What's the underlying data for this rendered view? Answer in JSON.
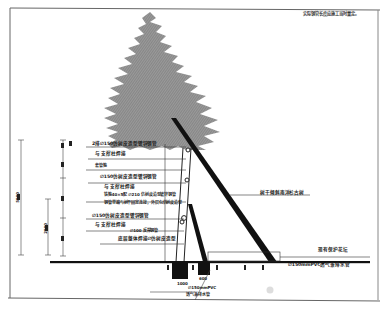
{
  "drawing": {
    "note_top_right": "实际钢管长度应施工当时量定。",
    "labels": {
      "top_pipe": "2排∅150仿树皮造型镀锌钢管",
      "top_pipe_sub": "与 支撑柱焊接",
      "anchor_ring": "套管箍",
      "mid_pipe": "∅150仿树皮造型镀锌钢管",
      "mid_pipe_sub": "与 支撑柱焊接",
      "clamp_note_1": "铁箍40×5配 ∅210 仿树皮造型镀锌钢管",
      "clamp_note_2": "钢管里端与树干固定连接，外层包仿树皮造型",
      "lower_pipe": "∅150仿树皮造型镀锌钢管",
      "lower_pipe_sub": "与 支撑柱焊接",
      "stake": "∅100 反撑钢管",
      "base_frame": "底层整体焊接∅仿树皮造型",
      "tree_name": "树干倾斜南洋杉古树",
      "existing_edge": "现有保护花坛",
      "drain_pipe": "∅150mmPVC透气兼排水管",
      "vent_pipe_1": "∅150mmPVC",
      "vent_pipe_2": "透气兼排水管"
    },
    "dimensions": {
      "overall_height": "5000",
      "mid_height": "2000",
      "segment_1": "800",
      "segment_2": "1500",
      "segment_3": "1200",
      "segment_4": "1500",
      "footing_width_1": "1000",
      "footing_width_2": "600"
    },
    "colors": {
      "line": "#1a1a1a",
      "tree_fill": "#8a8a8a",
      "frame": "#555555"
    }
  }
}
